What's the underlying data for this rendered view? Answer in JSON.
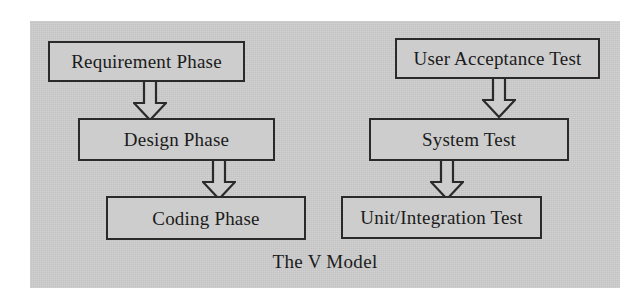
{
  "figure": {
    "caption": "The V Model",
    "background_color": "#cdcdcd",
    "line_color": "#2a2a2a",
    "page_color": "#ffffff"
  },
  "nodes": {
    "requirement_phase": "Requirement Phase",
    "design_phase": "Design Phase",
    "coding_phase": "Coding Phase",
    "user_acceptance_test": "User Acceptance Test",
    "system_test": "System Test",
    "unit_integration_test": "Unit/Integration Test"
  },
  "arrows": [
    {
      "name": "requirement-to-design",
      "from": "Requirement Phase",
      "to": "Design Phase",
      "direction": "down",
      "style": "hollow-block-arrow"
    },
    {
      "name": "design-to-coding",
      "from": "Design Phase",
      "to": "Coding Phase",
      "direction": "down",
      "style": "hollow-block-arrow"
    },
    {
      "name": "acceptance-to-system",
      "from": "User Acceptance Test",
      "to": "System Test",
      "direction": "down",
      "style": "hollow-block-arrow"
    },
    {
      "name": "system-to-unit",
      "from": "System Test",
      "to": "Unit/Integration Test",
      "direction": "down",
      "style": "hollow-block-arrow"
    }
  ]
}
